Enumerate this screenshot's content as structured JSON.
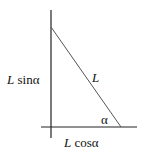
{
  "diagram": {
    "type": "right-triangle-components",
    "labels": {
      "hypotenuse": "L",
      "vertical_leg_var": "L",
      "vertical_leg_fn": " sinα",
      "horizontal_leg_var": "L",
      "horizontal_leg_fn": " cosα",
      "angle": "α"
    },
    "colors": {
      "axes": "#222222",
      "hypotenuse": "#555555",
      "text": "#111111"
    }
  }
}
